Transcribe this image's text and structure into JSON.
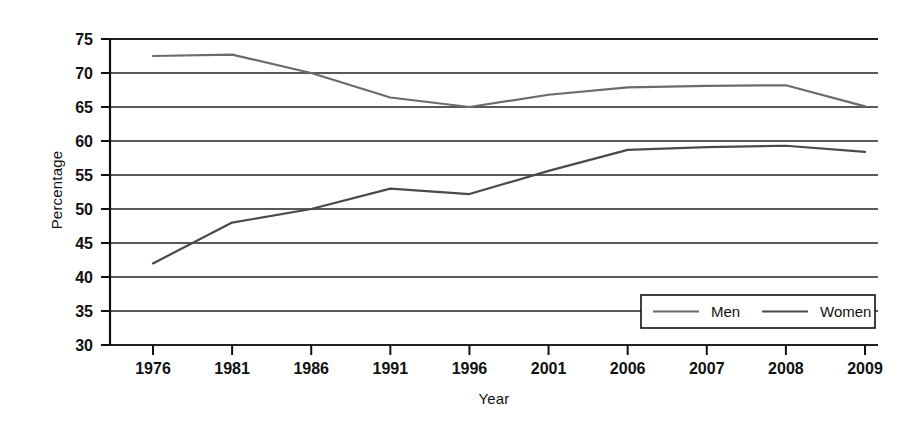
{
  "chart_data": {
    "type": "line",
    "title": "",
    "subtitle": "",
    "xlabel": "Year",
    "ylabel": "Percentage",
    "categories": [
      "1976",
      "1981",
      "1986",
      "1991",
      "1996",
      "2001",
      "2006",
      "2007",
      "2008",
      "2009"
    ],
    "series": [
      {
        "name": "Men",
        "color": "#6b6b6b",
        "values": [
          72.5,
          72.7,
          70.0,
          66.4,
          65.0,
          66.8,
          67.9,
          68.1,
          68.2,
          65.1
        ]
      },
      {
        "name": "Women",
        "color": "#4a4a4a",
        "values": [
          42.0,
          48.0,
          50.0,
          53.0,
          52.2,
          55.6,
          58.7,
          59.1,
          59.3,
          58.4
        ]
      }
    ],
    "ylim": [
      30,
      75
    ],
    "yticks": [
      "30",
      "35",
      "40",
      "45",
      "50",
      "55",
      "60",
      "65",
      "70",
      "75"
    ],
    "ytick_values": [
      30,
      35,
      40,
      45,
      50,
      55,
      60,
      65,
      70,
      75
    ],
    "xticks": [
      "1976",
      "1981",
      "1986",
      "1991",
      "1996",
      "2001",
      "2006",
      "2007",
      "2008",
      "2009"
    ],
    "grid": "horizontal",
    "legend_position": "bottom-right",
    "legend_entries": [
      "Men",
      "Women"
    ],
    "background_color": "#ffffff",
    "axis_color": "#111111",
    "grid_color": "#222222"
  }
}
